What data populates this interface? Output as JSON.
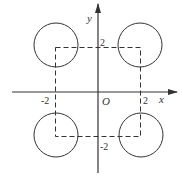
{
  "diagram": {
    "type": "coordinate-plane",
    "axes": {
      "x_label": "x",
      "y_label": "y",
      "origin_label": "O"
    },
    "ticks": {
      "x_neg": "-2",
      "x_pos": "2",
      "y_pos": "2",
      "y_neg": "-2"
    },
    "square": {
      "style": "dashed",
      "corners": [
        [
          -2,
          2
        ],
        [
          2,
          2
        ],
        [
          2,
          -2
        ],
        [
          -2,
          -2
        ]
      ]
    },
    "circles": [
      {
        "center": [
          -2,
          2
        ],
        "radius": 1
      },
      {
        "center": [
          2,
          2
        ],
        "radius": 1
      },
      {
        "center": [
          -2,
          -2
        ],
        "radius": 1
      },
      {
        "center": [
          2,
          -2
        ],
        "radius": 1
      }
    ],
    "colors": {
      "stroke": "#333333",
      "background": "#ffffff"
    }
  }
}
